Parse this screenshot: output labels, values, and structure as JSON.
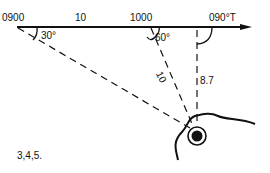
{
  "diagram": {
    "type": "running-fix-bearing-diagram",
    "course_line": {
      "start_label": "0900",
      "distance_label": "10",
      "mid_label": "1000",
      "course_label": "090°T"
    },
    "angles": {
      "first_bearing": "30°",
      "second_bearing": "60°"
    },
    "distances": {
      "second_bearing_distance": "10",
      "beam_distance": "8.7"
    },
    "landmark": "lighthouse-symbol",
    "caption": "3,4,5."
  },
  "colors": {
    "ink": "#111111",
    "background": "#ffffff"
  }
}
